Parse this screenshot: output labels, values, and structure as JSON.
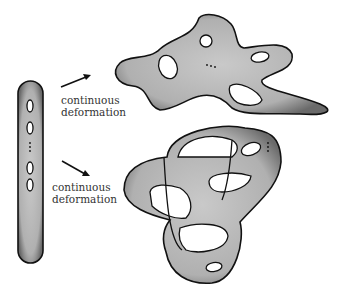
{
  "diagram": {
    "type": "topology-illustration",
    "source_surface": {
      "description": "elongated genus-g surface with holes in a vertical row",
      "holes_visible": 4,
      "ellipsis": "..."
    },
    "arrows": [
      {
        "label_line1": "continuous",
        "label_line2": "deformation",
        "direction": "up-right"
      },
      {
        "label_line1": "continuous",
        "label_line2": "deformation",
        "direction": "down-right"
      }
    ],
    "targets": [
      {
        "description": "irregular blob surface with holes",
        "holes_visible": 4,
        "ellipsis": "..."
      },
      {
        "description": "knotted surface with holes",
        "ellipsis": "..."
      }
    ]
  }
}
